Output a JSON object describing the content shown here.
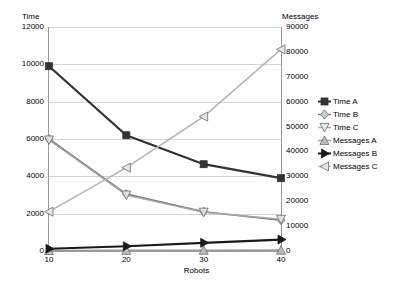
{
  "chart_data": {
    "type": "line",
    "title": "",
    "xlabel": "Robots",
    "ylabel": "Time",
    "y2label": "Messages",
    "x": [
      10,
      20,
      30,
      40
    ],
    "xtick_labels": [
      "10",
      "20",
      "30",
      "40"
    ],
    "ylim": [
      0,
      12000
    ],
    "ytick_labels": [
      "0",
      "2000",
      "4000",
      "6000",
      "8000",
      "10000",
      "12000"
    ],
    "ytick_values": [
      0,
      2000,
      4000,
      6000,
      8000,
      10000,
      12000
    ],
    "y2lim": [
      0,
      90000
    ],
    "y2tick_labels": [
      "0",
      "10000",
      "20000",
      "30000",
      "40000",
      "50000",
      "60000",
      "70000",
      "80000",
      "90000"
    ],
    "y2tick_values": [
      0,
      10000,
      20000,
      30000,
      40000,
      50000,
      60000,
      70000,
      80000,
      90000
    ],
    "grid": true,
    "legend_position": "right",
    "series": [
      {
        "name": "Time A",
        "axis": "left",
        "marker": "square",
        "color": "#333333",
        "values": [
          9900,
          6200,
          4650,
          3900
        ]
      },
      {
        "name": "Time B",
        "axis": "left",
        "marker": "diamond",
        "color": "#6e6e6e",
        "values": [
          6000,
          3050,
          2100,
          1650
        ]
      },
      {
        "name": "Time C",
        "axis": "left",
        "marker": "triangle-down",
        "color": "#a8a8a8",
        "values": [
          5950,
          3000,
          2080,
          1700
        ]
      },
      {
        "name": "Messages A",
        "axis": "right",
        "marker": "triangle-up",
        "color": "#9a9a9a",
        "values": [
          200,
          250,
          300,
          350
        ]
      },
      {
        "name": "Messages B",
        "axis": "right",
        "marker": "arrow-right",
        "color": "#1a1a1a",
        "values": [
          900,
          1900,
          3300,
          4600
        ]
      },
      {
        "name": "Messages C",
        "axis": "right",
        "marker": "triangle-left",
        "color": "#b4b4b4",
        "values": [
          15800,
          33500,
          54000,
          81000
        ]
      }
    ]
  },
  "axes": {
    "left_title": "Time",
    "right_title": "Messages",
    "x_title": "Robots"
  },
  "legend": {
    "items": [
      {
        "label": "Time A",
        "marker": "square-marker"
      },
      {
        "label": "Time B",
        "marker": "diamond-marker"
      },
      {
        "label": "Time C",
        "marker": "triangle-down-marker"
      },
      {
        "label": "Messages A",
        "marker": "triangle-up-marker"
      },
      {
        "label": "Messages B",
        "marker": "arrow-right-marker"
      },
      {
        "label": "Messages C",
        "marker": "triangle-left-marker"
      }
    ]
  }
}
